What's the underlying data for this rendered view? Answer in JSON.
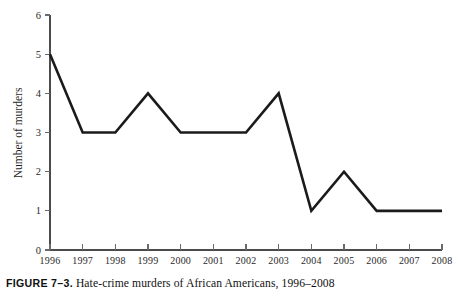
{
  "chart_data": {
    "type": "line",
    "title": "",
    "subtitle": "",
    "xlabel": "",
    "ylabel": "Number of murders",
    "categories": [
      "1996",
      "1997",
      "1998",
      "1999",
      "2000",
      "2001",
      "2002",
      "2003",
      "2004",
      "2005",
      "2006",
      "2007",
      "2008"
    ],
    "values": [
      5,
      3,
      3,
      4,
      3,
      3,
      3,
      4,
      1,
      2,
      1,
      1,
      1
    ],
    "series": [
      {
        "name": "Hate-crime murders of African Americans",
        "values": [
          5,
          3,
          3,
          4,
          3,
          3,
          3,
          4,
          1,
          2,
          1,
          1,
          1
        ],
        "color": "#1b1b1b"
      }
    ],
    "ylim": [
      0,
      6
    ],
    "ytick_labels": [
      "0",
      "1",
      "2",
      "3",
      "4",
      "5",
      "6"
    ],
    "ytick_values": [
      0,
      1,
      2,
      3,
      4,
      5,
      6
    ],
    "xtick_labels": [
      "1996",
      "1997",
      "1998",
      "1999",
      "2000",
      "2001",
      "2002",
      "2003",
      "2004",
      "2005",
      "2006",
      "2007",
      "2008"
    ],
    "grid": false,
    "legend": null,
    "legend_position": "none",
    "annotations": []
  },
  "caption": {
    "prefix": "FIGURE 7–3.",
    "text": " Hate-crime murders of African Americans, 1996–2008",
    "full": "FIGURE 7–3. Hate-crime murders of African Americans, 1996–2008"
  },
  "colors": {
    "line": "#1b1b1b",
    "axis": "#4b4b4b",
    "tick": "#6a6a6a",
    "text": "#1a1a1a",
    "background": "#ffffff"
  }
}
